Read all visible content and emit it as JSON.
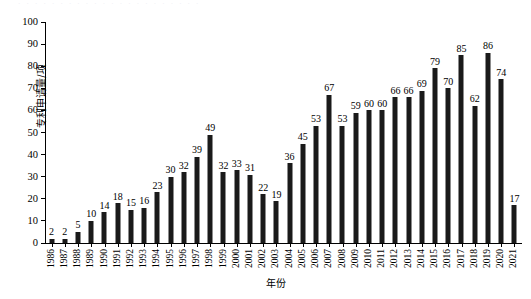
{
  "figure": {
    "top_strip_text": "· · · · · · · · · · · · · · · · · · · · · ·",
    "background": "#ffffff",
    "bar_color": "#1a1a1a",
    "axis_color": "#000000"
  },
  "chart_data": {
    "type": "bar",
    "title": "",
    "subtitle": "",
    "xlabel": "年份",
    "ylabel": "专利申请量/项",
    "ylim": [
      0,
      100
    ],
    "ytick_step": 10,
    "ytick_labels": [
      "0",
      "10",
      "20",
      "30",
      "40",
      "50",
      "60",
      "70",
      "80",
      "90",
      "100"
    ],
    "grid": false,
    "legend": false,
    "data_labels": true,
    "categories": [
      "1986",
      "1987",
      "1988",
      "1989",
      "1990",
      "1991",
      "1992",
      "1993",
      "1994",
      "1995",
      "1996",
      "1997",
      "1998",
      "1999",
      "2000",
      "2001",
      "2002",
      "2003",
      "2004",
      "2005",
      "2006",
      "2007",
      "2008",
      "2009",
      "2010",
      "2011",
      "2012",
      "2013",
      "2014",
      "2015",
      "2016",
      "2017",
      "2018",
      "2019",
      "2020",
      "2021"
    ],
    "values": [
      2,
      2,
      5,
      10,
      14,
      18,
      15,
      16,
      23,
      30,
      32,
      39,
      49,
      32,
      33,
      31,
      22,
      19,
      36,
      45,
      53,
      67,
      53,
      59,
      60,
      60,
      66,
      66,
      69,
      79,
      70,
      85,
      62,
      86,
      74,
      17
    ]
  }
}
